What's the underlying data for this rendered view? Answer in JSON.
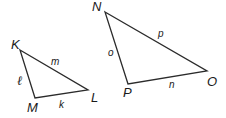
{
  "diagram": {
    "type": "similar-triangles",
    "colors": {
      "stroke": "#2b2b2b",
      "text": "#1a1a1a",
      "background": "#ffffff"
    },
    "triangles": [
      {
        "name": "KLM",
        "vertices": [
          {
            "label": "K",
            "x": 20,
            "y": 50
          },
          {
            "label": "L",
            "x": 88,
            "y": 90
          },
          {
            "label": "M",
            "x": 35,
            "y": 98
          }
        ],
        "sides": [
          {
            "between": "K-L",
            "label": "m"
          },
          {
            "between": "K-M",
            "label": "ℓ"
          },
          {
            "between": "M-L",
            "label": "k"
          }
        ]
      },
      {
        "name": "NOP",
        "vertices": [
          {
            "label": "N",
            "x": 105,
            "y": 12
          },
          {
            "label": "O",
            "x": 207,
            "y": 71
          },
          {
            "label": "P",
            "x": 128,
            "y": 84
          }
        ],
        "sides": [
          {
            "between": "N-O",
            "label": "p"
          },
          {
            "between": "N-P",
            "label": "o"
          },
          {
            "between": "P-O",
            "label": "n"
          }
        ]
      }
    ]
  }
}
